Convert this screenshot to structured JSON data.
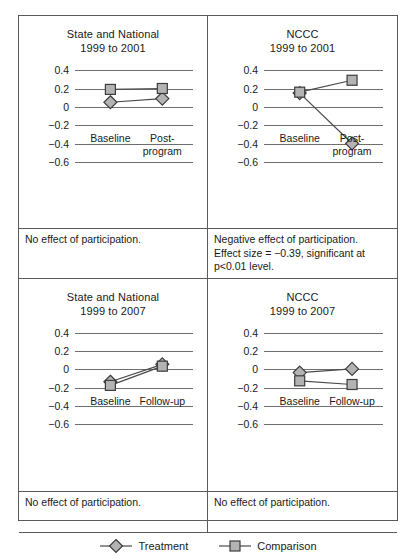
{
  "chart_data": {
    "type": "line",
    "title": "",
    "ylim": [
      -0.7,
      0.5
    ],
    "yticks": [
      0.4,
      0.2,
      0,
      -0.2,
      -0.4,
      -0.6
    ],
    "ytick_labels": [
      "0.4",
      "0.2",
      "0",
      "−0.2",
      "−0.4",
      "−0.6"
    ],
    "grid": true,
    "legend_position": "bottom",
    "legend": [
      {
        "name": "Treatment",
        "marker": "diamond"
      },
      {
        "name": "Comparison",
        "marker": "square"
      }
    ],
    "panels": [
      {
        "id": "state-national-1999-2001",
        "title_line1": "State and National",
        "title_line2": "1999 to 2001",
        "categories": [
          "Baseline",
          "Post-program"
        ],
        "xtick_line1": [
          "Baseline",
          "Post-"
        ],
        "xtick_line2": [
          "",
          "program"
        ],
        "series": [
          {
            "name": "Treatment",
            "marker": "diamond",
            "values": [
              0.05,
              0.09
            ]
          },
          {
            "name": "Comparison",
            "marker": "square",
            "values": [
              0.19,
              0.2
            ]
          }
        ],
        "note_lines": [
          "No effect of participation."
        ]
      },
      {
        "id": "nccc-1999-2001",
        "title_line1": "NCCC",
        "title_line2": "1999 to 2001",
        "categories": [
          "Baseline",
          "Post-program"
        ],
        "xtick_line1": [
          "Baseline",
          "Post-"
        ],
        "xtick_line2": [
          "",
          "program"
        ],
        "series": [
          {
            "name": "Treatment",
            "marker": "diamond",
            "values": [
              0.15,
              -0.4
            ]
          },
          {
            "name": "Comparison",
            "marker": "square",
            "values": [
              0.16,
              0.29
            ]
          }
        ],
        "note_lines": [
          "Negative effect of participation.",
          "Effect size = −0.39, significant at",
          "p<0.01 level."
        ]
      },
      {
        "id": "state-national-1999-2007",
        "title_line1": "State and National",
        "title_line2": "1999 to 2007",
        "categories": [
          "Baseline",
          "Follow-up"
        ],
        "xtick_line1": [
          "Baseline",
          "Follow-up"
        ],
        "xtick_line2": [
          "",
          ""
        ],
        "series": [
          {
            "name": "Treatment",
            "marker": "diamond",
            "values": [
              -0.13,
              0.06
            ]
          },
          {
            "name": "Comparison",
            "marker": "square",
            "values": [
              -0.17,
              0.04
            ]
          }
        ],
        "note_lines": [
          "No effect of participation."
        ]
      },
      {
        "id": "nccc-1999-2007",
        "title_line1": "NCCC",
        "title_line2": "1999 to 2007",
        "categories": [
          "Baseline",
          "Follow-up"
        ],
        "xtick_line1": [
          "Baseline",
          "Follow-up"
        ],
        "xtick_line2": [
          "",
          ""
        ],
        "series": [
          {
            "name": "Treatment",
            "marker": "diamond",
            "values": [
              -0.03,
              0.01
            ]
          },
          {
            "name": "Comparison",
            "marker": "square",
            "values": [
              -0.12,
              -0.16
            ]
          }
        ],
        "note_lines": [
          "No effect of participation."
        ]
      }
    ]
  },
  "style": {
    "marker_fill": "#b3b3b3",
    "marker_stroke": "#3c3c3c",
    "line_color": "#4a4a4a",
    "grid_color": "#6e6e6e",
    "frame_color": "#5a5a5a"
  }
}
